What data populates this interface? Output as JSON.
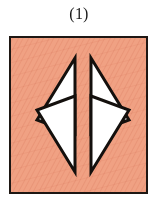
{
  "figure": {
    "caption": "(1)",
    "panel": {
      "background_color": "#F0A183",
      "border_color": "#1E1713",
      "border_width_px": 2,
      "width_px": 139,
      "height_px": 158,
      "texture": "paper-grain-hatching"
    },
    "shapes": [
      {
        "id": "triangle-top-left",
        "name": "triangle-top-left",
        "fill_color": "#FFFFFF",
        "stroke_color": "#14100D",
        "stroke_width_px": 3,
        "orientation": "points-left",
        "points": "66,22 66,98 28,84"
      },
      {
        "id": "triangle-top-right",
        "name": "triangle-top-right",
        "fill_color": "#FFFFFF",
        "stroke_color": "#14100D",
        "stroke_width_px": 3,
        "orientation": "points-right",
        "points": "82,22 82,98 120,84"
      },
      {
        "id": "triangle-bottom-left",
        "name": "triangle-bottom-left",
        "fill_color": "#FFFFFF",
        "stroke_color": "#14100D",
        "stroke_width_px": 3,
        "orientation": "points-left",
        "points": "66,136 66,60 28,74"
      },
      {
        "id": "triangle-bottom-right",
        "name": "triangle-bottom-right",
        "fill_color": "#FFFFFF",
        "stroke_color": "#14100D",
        "stroke_width_px": 3,
        "orientation": "points-right",
        "points": "82,136 82,60 120,74"
      }
    ]
  }
}
